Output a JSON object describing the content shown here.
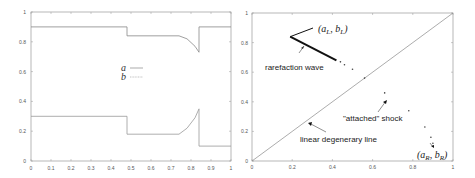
{
  "chart_data": [
    {
      "type": "line",
      "title": "",
      "xlabel": "",
      "ylabel": "",
      "xlim": [
        0,
        1
      ],
      "ylim": [
        0,
        1
      ],
      "grid": false,
      "legend_position": "center",
      "x_ticks": [
        "0",
        "0.1",
        "0.2",
        "0.3",
        "0.4",
        "0.5",
        "0.6",
        "0.7",
        "0.8",
        "0.9",
        "1"
      ],
      "y_ticks": [
        "0",
        "0.2",
        "0.4",
        "0.6",
        "0.8",
        "1"
      ],
      "series": [
        {
          "name": "a",
          "style": "solid",
          "x": [
            0,
            0.48,
            0.48,
            0.74,
            0.78,
            0.82,
            0.84,
            0.84,
            1
          ],
          "y": [
            0.9,
            0.9,
            0.84,
            0.84,
            0.82,
            0.77,
            0.73,
            0.9,
            0.9
          ]
        },
        {
          "name": "b",
          "style": "dotted",
          "x": [
            0,
            0.48,
            0.48,
            0.74,
            0.78,
            0.82,
            0.84,
            0.84,
            1
          ],
          "y": [
            0.3,
            0.3,
            0.18,
            0.18,
            0.22,
            0.29,
            0.35,
            0.1,
            0.1
          ]
        }
      ]
    },
    {
      "type": "scatter",
      "title": "",
      "xlabel": "",
      "ylabel": "",
      "xlim": [
        0,
        1
      ],
      "ylim": [
        0,
        1
      ],
      "grid": false,
      "x_ticks": [
        "0",
        "0.2",
        "0.4",
        "0.6",
        "0.8",
        "1"
      ],
      "y_ticks": [
        "0",
        "0.2",
        "0.4",
        "0.6",
        "0.8",
        "1"
      ],
      "diagonal_line": {
        "x": [
          0,
          1
        ],
        "y": [
          0,
          1
        ]
      },
      "rarefaction_segment": {
        "x": [
          0.19,
          0.42
        ],
        "y": [
          0.84,
          0.68
        ]
      },
      "points": {
        "x": [
          0.44,
          0.46,
          0.5,
          0.56,
          0.66,
          0.78,
          0.86,
          0.89,
          0.9
        ],
        "y": [
          0.67,
          0.65,
          0.62,
          0.56,
          0.46,
          0.34,
          0.23,
          0.16,
          0.12
        ]
      },
      "annotations": [
        {
          "text": "(a_L, b_L)",
          "x": 0.33,
          "y": 0.9
        },
        {
          "text": "rarefaction wave",
          "x": 0.07,
          "y": 0.64
        },
        {
          "text": "\"attached\" shock",
          "x": 0.46,
          "y": 0.3
        },
        {
          "text": "linear degenerary line",
          "x": 0.24,
          "y": 0.15
        },
        {
          "text": "(a_R, b_R)",
          "x": 0.82,
          "y": 0.05
        }
      ]
    }
  ],
  "left_plot": {
    "legend": {
      "a_label": "a",
      "b_label": "b"
    },
    "x_ticks": [
      "0",
      "0.1",
      "0.2",
      "0.3",
      "0.4",
      "0.5",
      "0.6",
      "0.7",
      "0.8",
      "0.9",
      "1"
    ],
    "y_ticks": [
      "0",
      "0.2",
      "0.4",
      "0.6",
      "0.8",
      "1"
    ]
  },
  "right_plot": {
    "x_ticks": [
      "0",
      "0.2",
      "0.4",
      "0.6",
      "0.8",
      "1"
    ],
    "y_ticks": [
      "0",
      "0.2",
      "0.4",
      "0.6",
      "0.8",
      "1"
    ],
    "labels": {
      "aL": "a",
      "aL_sub": "L",
      "bL": "b",
      "bL_sub": "L",
      "aR": "a",
      "aR_sub": "R",
      "bR": "b",
      "bR_sub": "R",
      "rarefaction": "rarefaction wave",
      "shock": "\"attached\" shock",
      "degenerate": "linear degenerary line"
    }
  }
}
